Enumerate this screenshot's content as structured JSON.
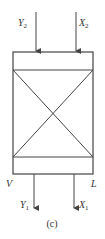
{
  "diagram": {
    "caption": "(c)",
    "inlet_labels": {
      "top_left": {
        "main": "Y",
        "sub": "2"
      },
      "top_right": {
        "main": "X",
        "sub": "2"
      }
    },
    "outlet_labels": {
      "bottom_left": {
        "main": "Y",
        "sub": "1"
      },
      "bottom_right": {
        "main": "X",
        "sub": "1"
      }
    },
    "stream_labels": {
      "left": "V",
      "right": "L"
    },
    "colors": {
      "stroke": "#444444",
      "text": "#333333"
    }
  }
}
